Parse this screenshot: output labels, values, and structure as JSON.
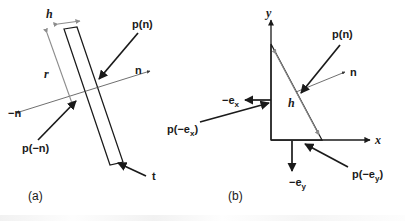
{
  "figure": {
    "background_color": "#ffffff",
    "ink_color": "#1a1a1a",
    "dimension_color": "#8c8c8c",
    "thin_line_color": "#4a4a4a",
    "width": 405,
    "height": 221
  },
  "panel_a": {
    "caption": "(a)",
    "description": "Thin tilted slab (pillbox) with traction vectors on opposite faces",
    "labels": {
      "thickness": "h",
      "length": "r",
      "traction_plus": "p(n)",
      "traction_minus": "p(−n)",
      "normal_plus": "n",
      "normal_minus": "−n",
      "tangent": "t"
    }
  },
  "panel_b": {
    "caption": "(b)",
    "description": "Cauchy tetrahedron (2D triangle) with axis unit vectors and tractions",
    "labels": {
      "axis_x": "x",
      "axis_y": "y",
      "hypotenuse": "h",
      "traction_n": "p(n)",
      "normal": "n",
      "basis_minus_x": "−e",
      "basis_minus_x_sub": "x",
      "basis_minus_y": "−e",
      "basis_minus_y_sub": "y",
      "traction_minus_ex": "p(−e",
      "traction_minus_ex_sub": "x",
      "traction_minus_ex_tail": ")",
      "traction_minus_ey": "p(−e",
      "traction_minus_ey_sub": "y",
      "traction_minus_ey_tail": ")"
    }
  }
}
